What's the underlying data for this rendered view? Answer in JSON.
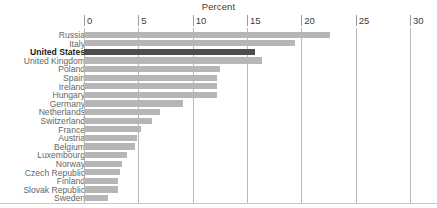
{
  "chart_data": {
    "type": "bar",
    "orientation": "horizontal",
    "title": "Percent",
    "xlabel": "Percent",
    "ylabel": "",
    "xlim": [
      0,
      30
    ],
    "xticks": [
      0,
      5,
      10,
      15,
      20,
      25,
      30
    ],
    "xtick_labels": [
      "0",
      "5",
      "10",
      "15",
      "20",
      "25",
      "30"
    ],
    "grid": true,
    "legend": "none",
    "categories": [
      "Russia",
      "Italy",
      "United States",
      "United Kingdom",
      "Poland",
      "Spain",
      "Ireland",
      "Hungary",
      "Germany",
      "Netherlands",
      "Switzerland",
      "France",
      "Austria",
      "Belgium",
      "Luxembourg",
      "Norway",
      "Czech Republic",
      "Finland",
      "Slovak Republic",
      "Sweden"
    ],
    "values": [
      22.6,
      19.4,
      15.7,
      16.4,
      12.5,
      12.2,
      12.2,
      12.2,
      9.1,
      7.0,
      6.3,
      5.2,
      4.9,
      4.7,
      4.0,
      3.5,
      3.3,
      3.1,
      3.1,
      2.2
    ],
    "highlight_category": "United States",
    "colors": {
      "bar": "#b6b6b6",
      "bar_highlight": "#4d4d4d",
      "gridline": "#b9b9b9",
      "label": "#666666",
      "label_highlight": "#1a1a1a",
      "title": "#3c3c3c",
      "background": "#ffffff"
    }
  }
}
